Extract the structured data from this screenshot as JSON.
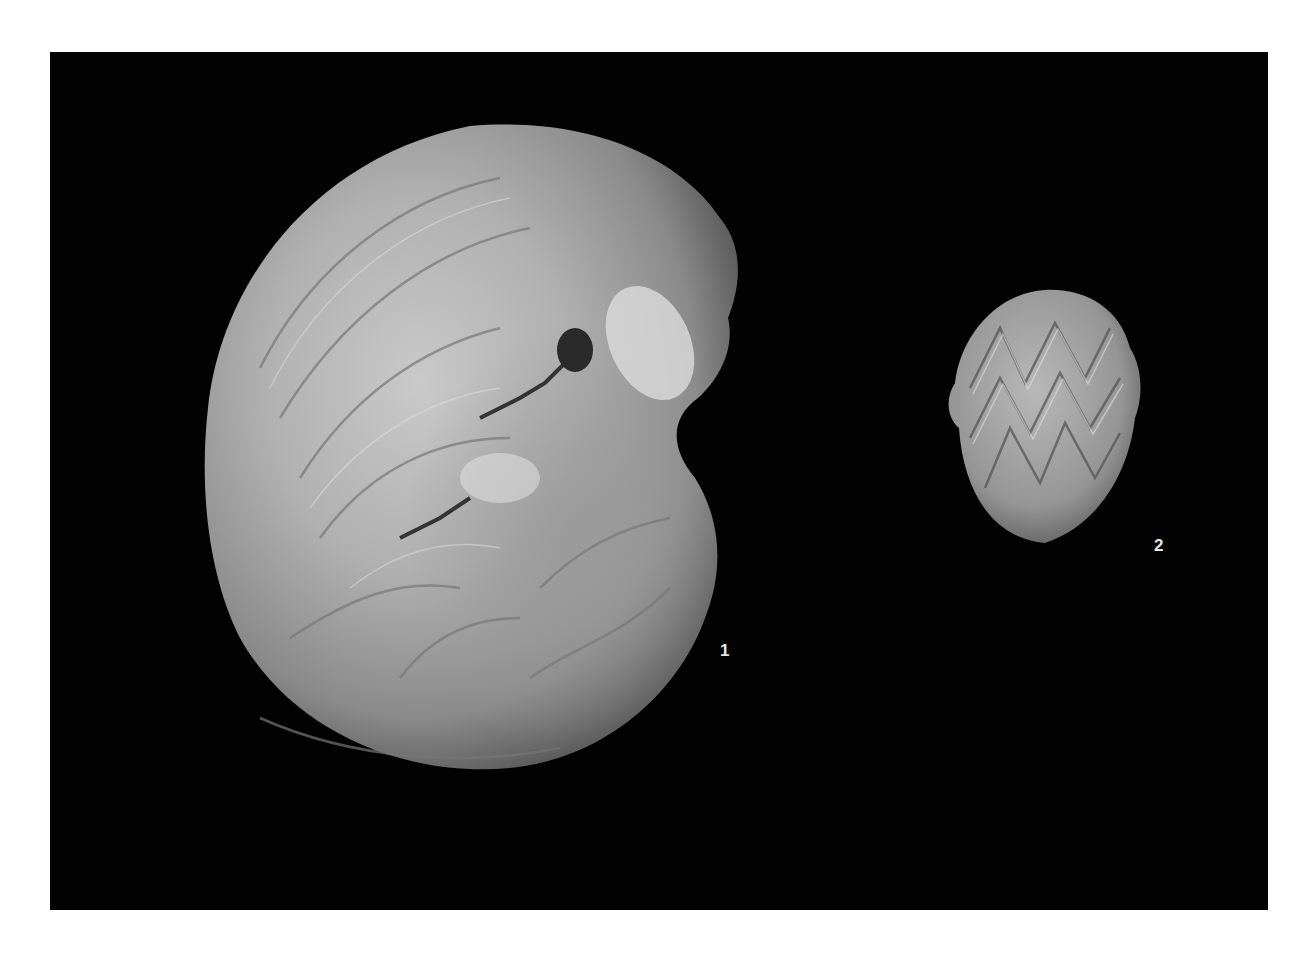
{
  "plate": {
    "background": "#020202",
    "page_background": "#ffffff"
  },
  "figures": [
    {
      "label": "1",
      "description": "large involute coiled shell (ammonoid/nautiloid), lateral view, with whorl and suture markings"
    },
    {
      "label": "2",
      "description": "small ovoid shell, ventral view, with chevron/zigzag suture pattern"
    }
  ]
}
